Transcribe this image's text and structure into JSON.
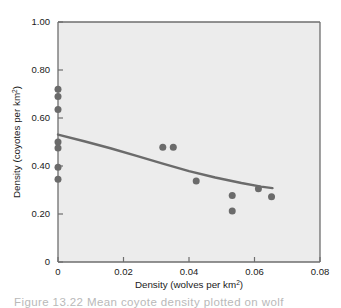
{
  "figure": {
    "background_color": "#ffffff",
    "plot_background_color": "#ececec",
    "axis_color": "#6e6e6e",
    "marker_color": "#6b6b6b",
    "line_color": "#6b6b6b",
    "caption_partial": "Figure 13.22  Mean coyote density plotted on wolf"
  },
  "chart_data": {
    "type": "scatter",
    "title": "",
    "xlabel": "Density (wolves per km",
    "xlabel_sup": "2",
    "xlabel_tail": ")",
    "ylabel": "Density (coyotes per km",
    "ylabel_sup": "2",
    "ylabel_tail": ")",
    "xlim": [
      0,
      0.08
    ],
    "ylim": [
      0,
      1.0
    ],
    "xticks": [
      0,
      0.02,
      0.04,
      0.06,
      0.08
    ],
    "xtick_labels": [
      "0",
      "0.02",
      "0.04",
      "0.06",
      "0.08"
    ],
    "yticks": [
      0,
      0.2,
      0.4,
      0.6,
      0.8,
      1.0
    ],
    "ytick_labels": [
      "0",
      "0.20",
      "0.40",
      "0.60",
      "0.80",
      "1.00"
    ],
    "grid": false,
    "legend": "none",
    "points": [
      {
        "x": 0.0,
        "y": 0.72
      },
      {
        "x": 0.0,
        "y": 0.69
      },
      {
        "x": 0.0,
        "y": 0.635
      },
      {
        "x": 0.0,
        "y": 0.5
      },
      {
        "x": 0.0,
        "y": 0.475
      },
      {
        "x": 0.0,
        "y": 0.395
      },
      {
        "x": 0.0,
        "y": 0.345
      },
      {
        "x": 0.032,
        "y": 0.478
      },
      {
        "x": 0.0352,
        "y": 0.478
      },
      {
        "x": 0.0422,
        "y": 0.337
      },
      {
        "x": 0.0532,
        "y": 0.277
      },
      {
        "x": 0.0532,
        "y": 0.212
      },
      {
        "x": 0.0612,
        "y": 0.305
      },
      {
        "x": 0.0652,
        "y": 0.272
      }
    ],
    "trend_line": {
      "name": "fitted curve",
      "points": [
        {
          "x": 0.0,
          "y": 0.531
        },
        {
          "x": 0.008,
          "y": 0.503
        },
        {
          "x": 0.016,
          "y": 0.474
        },
        {
          "x": 0.024,
          "y": 0.442
        },
        {
          "x": 0.032,
          "y": 0.41
        },
        {
          "x": 0.04,
          "y": 0.379
        },
        {
          "x": 0.048,
          "y": 0.352
        },
        {
          "x": 0.056,
          "y": 0.329
        },
        {
          "x": 0.062,
          "y": 0.314
        },
        {
          "x": 0.0655,
          "y": 0.308
        }
      ]
    }
  }
}
